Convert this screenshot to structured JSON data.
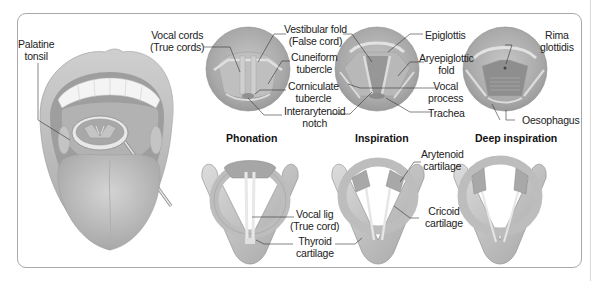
{
  "figure": {
    "panel_titles": {
      "phonation": "Phonation",
      "inspiration": "Inspiration",
      "deep_inspiration": "Deep inspiration"
    },
    "labels": {
      "palatine_tonsil": [
        "Palatine",
        "tonsil"
      ],
      "vocal_cords": [
        "Vocal cords",
        "(True cords)"
      ],
      "vestibular_fold": [
        "Vestibular fold",
        "(False cord)"
      ],
      "cuneiform_tubercle": [
        "Cuneiform",
        "tubercle"
      ],
      "corniculate_tubercle": [
        "Corniculate",
        "tubercle"
      ],
      "interarytenoid_notch": [
        "Interarytenoid",
        "notch"
      ],
      "epiglottis": [
        "Epiglottis"
      ],
      "aryepiglottic_fold": [
        "Aryepiglottic",
        "fold"
      ],
      "vocal_process": [
        "Vocal",
        "process"
      ],
      "trachea": [
        "Trachea"
      ],
      "rima_glottidis": [
        "Rima",
        "glottidis"
      ],
      "oesophagus": [
        "Oesophagus"
      ],
      "arytenoid_cartilage": [
        "Arytenoid",
        "cartilage"
      ],
      "cricoid_cartilage": [
        "Cricoid",
        "cartilage"
      ],
      "vocal_lig": [
        "Vocal lig",
        "(True cord)"
      ],
      "thyroid_cartilage": [
        "Thyroid",
        "cartilage"
      ]
    },
    "colors": {
      "frame_border": "#a8a8a8",
      "tissue_light": "#d2d2d2",
      "tissue_mid": "#b4b4b4",
      "tissue_dark": "#8e8e8e",
      "leader_line": "#333333",
      "text": "#222222"
    }
  }
}
